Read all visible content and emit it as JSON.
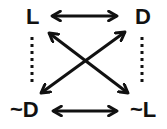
{
  "diagram": {
    "nodes": {
      "top_left": {
        "label": "L"
      },
      "top_right": {
        "label": "D"
      },
      "bottom_left": {
        "label": "~D"
      },
      "bottom_right": {
        "label": "~L"
      }
    },
    "edges": [
      {
        "from": "L",
        "to": "D",
        "style": "solid",
        "arrows": "both"
      },
      {
        "from": "~D",
        "to": "~L",
        "style": "solid",
        "arrows": "both"
      },
      {
        "from": "L",
        "to": "~L",
        "style": "solid",
        "arrows": "both"
      },
      {
        "from": "D",
        "to": "~D",
        "style": "solid",
        "arrows": "both"
      },
      {
        "from": "L",
        "to": "~D",
        "style": "dotted",
        "arrows": "none"
      },
      {
        "from": "D",
        "to": "~L",
        "style": "dotted",
        "arrows": "none"
      }
    ],
    "colors": {
      "ink": "#111111",
      "background": "#ffffff"
    }
  }
}
